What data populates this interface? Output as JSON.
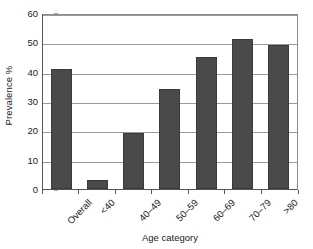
{
  "chart_data": {
    "type": "bar",
    "title": "",
    "subtitle": "",
    "xlabel": "Age category",
    "ylabel": "Prevalence %",
    "categories": [
      "Overall",
      "<40",
      "40–49",
      "50–59",
      "60–69",
      "70–79",
      ">80"
    ],
    "values": [
      41,
      3,
      19,
      34,
      45,
      51,
      49
    ],
    "ylim": [
      0,
      60
    ],
    "yticks": [
      0,
      10,
      20,
      30,
      40,
      50,
      60
    ],
    "ytick_labels": [
      "0",
      "10",
      "20",
      "30",
      "40",
      "50",
      "60"
    ],
    "grid": "horizontal",
    "legend": "none",
    "bar_color": "#4a4a4a",
    "axis_color": "#555555",
    "gridline_color": "#9a9a9a",
    "background": "#ffffff",
    "xtick_label_rotation": -45,
    "annotations": []
  }
}
